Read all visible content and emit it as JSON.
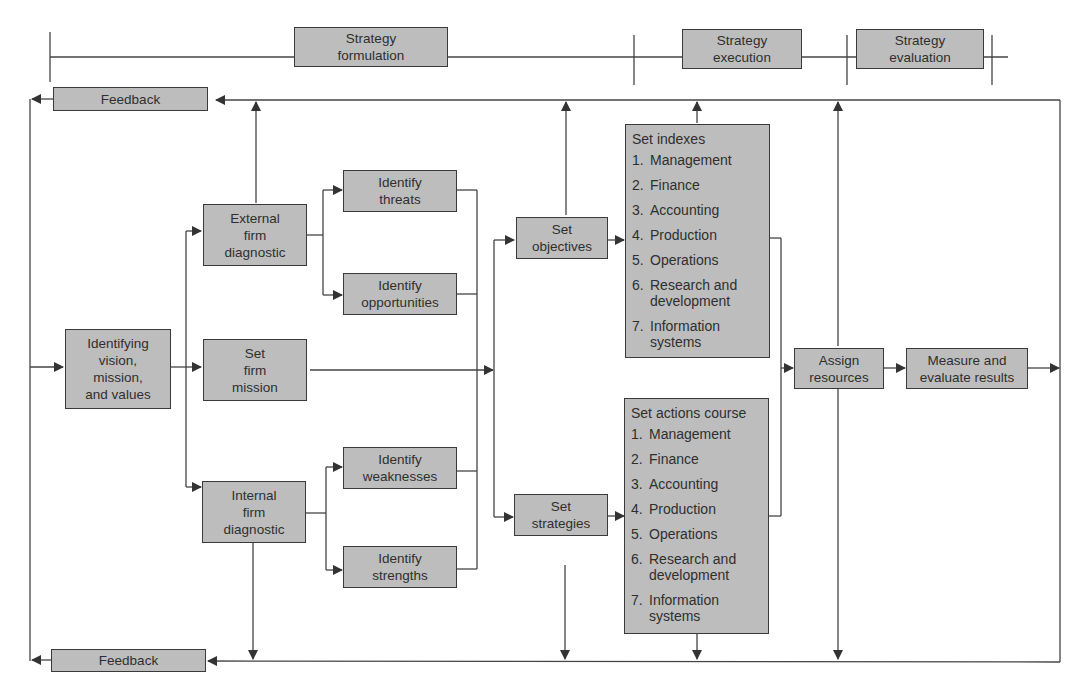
{
  "phases": [
    {
      "id": "formulation",
      "line1": "Strategy",
      "line2": "formulation"
    },
    {
      "id": "execution",
      "line1": "Strategy",
      "line2": "execution"
    },
    {
      "id": "evaluation",
      "line1": "Strategy",
      "line2": "evaluation"
    }
  ],
  "feedback": {
    "top": "Feedback",
    "bottom": "Feedback"
  },
  "nodes": {
    "vision": [
      "Identifying",
      "vision,",
      "mission,",
      "and values"
    ],
    "external": [
      "External",
      "firm",
      "diagnostic"
    ],
    "mission": [
      "Set",
      "firm",
      "mission"
    ],
    "internal": [
      "Internal",
      "firm",
      "diagnostic"
    ],
    "threats": [
      "Identify",
      "threats"
    ],
    "opportunities": [
      "Identify",
      "opportunities"
    ],
    "weaknesses": [
      "Identify",
      "weaknesses"
    ],
    "strengths": [
      "Identify",
      "strengths"
    ],
    "objectives": [
      "Set",
      "objectives"
    ],
    "strategies": [
      "Set",
      "strategies"
    ],
    "assign": [
      "Assign",
      "resources"
    ],
    "measure": [
      "Measure and",
      "evaluate results"
    ]
  },
  "indexes": {
    "title": "Set indexes",
    "items": [
      {
        "num": "1.",
        "text": "Management"
      },
      {
        "num": "2.",
        "text": "Finance"
      },
      {
        "num": "3.",
        "text": "Accounting"
      },
      {
        "num": "4.",
        "text": "Production"
      },
      {
        "num": "5.",
        "text": "Operations"
      },
      {
        "num": "6.",
        "text": "Research and development"
      },
      {
        "num": "7.",
        "text": "Information systems"
      }
    ]
  },
  "actions": {
    "title": "Set actions course",
    "items": [
      {
        "num": "1.",
        "text": "Management"
      },
      {
        "num": "2.",
        "text": "Finance"
      },
      {
        "num": "3.",
        "text": "Accounting"
      },
      {
        "num": "4.",
        "text": "Production"
      },
      {
        "num": "5.",
        "text": "Operations"
      },
      {
        "num": "6.",
        "text": "Research and development"
      },
      {
        "num": "7.",
        "text": "Information systems"
      }
    ]
  },
  "colors": {
    "box_fill": "#bdbdbd",
    "line": "#3a3a3a",
    "background": "#ffffff"
  }
}
